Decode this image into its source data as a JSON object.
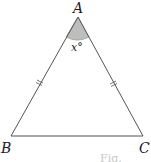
{
  "diagram": {
    "type": "isosceles-triangle",
    "vertices": {
      "top": "A",
      "left": "B",
      "right": "C"
    },
    "angle_label": "x°",
    "marked_angle_at": "A",
    "equal_sides": [
      "AB",
      "AC"
    ],
    "equal_side_marker": "double tick",
    "colors": {
      "stroke": "#555555",
      "angle_fill": "#bdbdbd"
    },
    "caption_partial": "Fig."
  }
}
